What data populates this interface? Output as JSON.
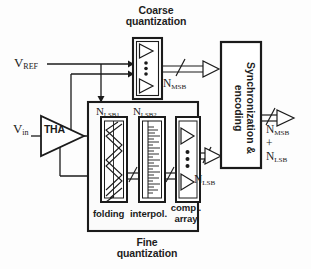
{
  "diagram": {
    "stroke_color": "#1b1b1b",
    "background_color": "#fdfdfd"
  },
  "inputs": {
    "vref": "V",
    "vref_sub": "REF",
    "vin": "V",
    "vin_sub": "in",
    "tha": "THA"
  },
  "coarse": {
    "caption_line1": "Coarse",
    "caption_line2": "quantization",
    "bus_label": "N",
    "bus_label_sub": "MSB",
    "dots": 3
  },
  "fine": {
    "caption_line1": "Fine",
    "caption_line2": "quantization",
    "bus_label": "N",
    "bus_label_sub": "LSB",
    "res1": "N",
    "res1_sub": "LSB1",
    "res2": "N",
    "res2_sub": "LSB2",
    "blocks": [
      {
        "label": "folding",
        "name": "folding-block"
      },
      {
        "label": "interpol.",
        "name": "interpolation-block"
      },
      {
        "label_line1": "comp .",
        "label_line2": "array",
        "name": "comparator-array-block"
      }
    ],
    "comp_dots": 3
  },
  "sync": {
    "label": "Synchronization & encoding"
  },
  "output": {
    "line1": "N",
    "line1_sub": "MSB",
    "line2": "+",
    "line3": "N",
    "line3_sub": "LSB"
  }
}
